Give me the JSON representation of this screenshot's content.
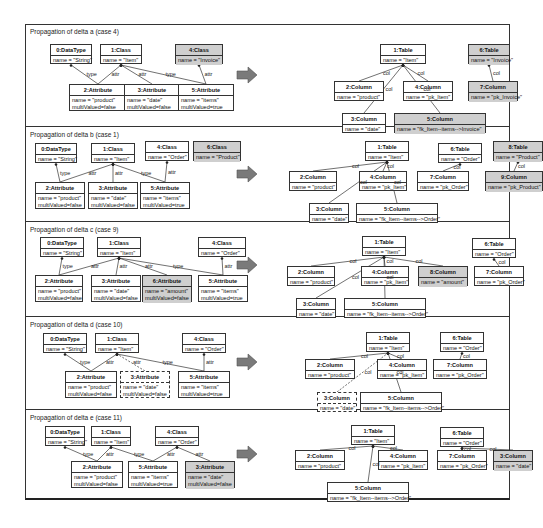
{
  "colors": {
    "border": "#333333",
    "highlight": "#cfcfcf",
    "arrow": "#7a7a7a"
  },
  "arrow_icon": "right-arrow-icon",
  "panels": [
    {
      "title": "Propagation of delta a (case 4)",
      "source": [
        {
          "id": "0:DataType",
          "attrs": [
            "name = \"String\""
          ]
        },
        {
          "id": "1:Class",
          "attrs": [
            "name = \"Item\""
          ]
        },
        {
          "id": "4:Class",
          "attrs": [
            "name = \"Invoice\""
          ],
          "highlight": true
        },
        {
          "id": "2:Attribute",
          "attrs": [
            "name = \"product\"",
            "multiValued=false"
          ]
        },
        {
          "id": "3:Attribute",
          "attrs": [
            "name = \"date\"",
            "multiValued=false"
          ]
        },
        {
          "id": "5:Attribute",
          "attrs": [
            "name = \"items\"",
            "multiValued=true"
          ]
        }
      ],
      "target": [
        {
          "id": "1:Table",
          "attrs": [
            "name = \"Item\""
          ]
        },
        {
          "id": "6:Table",
          "attrs": [
            "name = \"Invoice\""
          ],
          "highlight": true
        },
        {
          "id": "2:Column",
          "attrs": [
            "name = \"product\""
          ]
        },
        {
          "id": "4:Column",
          "attrs": [
            "name = \"pk_Item\""
          ]
        },
        {
          "id": "7:Column",
          "attrs": [
            "name = \"pk_Invoice\""
          ],
          "highlight": true
        },
        {
          "id": "3:Column",
          "attrs": [
            "name = \"date\""
          ]
        },
        {
          "id": "5:Column",
          "attrs": [
            "name = \"fk_Item--items-->Invoice\""
          ],
          "highlight": true
        }
      ]
    },
    {
      "title": "Propagation of delta b (case 1)",
      "source": [
        {
          "id": "0:DataType",
          "attrs": [
            "name = \"String\""
          ]
        },
        {
          "id": "1:Class",
          "attrs": [
            "name = \"Item\""
          ]
        },
        {
          "id": "4:Class",
          "attrs": [
            "name = \"Order\""
          ]
        },
        {
          "id": "6:Class",
          "attrs": [
            "name = \"Product\""
          ],
          "highlight": true
        },
        {
          "id": "2:Attribute",
          "attrs": [
            "name = \"product\"",
            "multiValued=false"
          ]
        },
        {
          "id": "3:Attribute",
          "attrs": [
            "name = \"date\"",
            "multiValued=false"
          ]
        },
        {
          "id": "5:Attribute",
          "attrs": [
            "name = \"items\"",
            "multiValued=true"
          ]
        }
      ],
      "target": [
        {
          "id": "1:Table",
          "attrs": [
            "name = \"Item\""
          ]
        },
        {
          "id": "6:Table",
          "attrs": [
            "name = \"Order\""
          ]
        },
        {
          "id": "8:Table",
          "attrs": [
            "name = \"Product\""
          ],
          "highlight": true
        },
        {
          "id": "2:Column",
          "attrs": [
            "name = \"product\""
          ]
        },
        {
          "id": "4:Column",
          "attrs": [
            "name = \"pk_Item\""
          ]
        },
        {
          "id": "7:Column",
          "attrs": [
            "name = \"pk_Order\""
          ]
        },
        {
          "id": "9:Column",
          "attrs": [
            "name = \"pk_Product\""
          ],
          "highlight": true
        },
        {
          "id": "3:Column",
          "attrs": [
            "name = \"date\""
          ]
        },
        {
          "id": "5:Column",
          "attrs": [
            "name = \"fk_Item--items-->Order\""
          ]
        }
      ]
    },
    {
      "title": "Propagation of delta c (case 9)",
      "source": [
        {
          "id": "0:DataType",
          "attrs": [
            "name = \"String\""
          ]
        },
        {
          "id": "1:Class",
          "attrs": [
            "name = \"Item\""
          ]
        },
        {
          "id": "4:Class",
          "attrs": [
            "name = \"Order\""
          ]
        },
        {
          "id": "2:Attribute",
          "attrs": [
            "name = \"product\"",
            "multiValued=false"
          ]
        },
        {
          "id": "3:Attribute",
          "attrs": [
            "name = \"date\"",
            "multiValued=false"
          ]
        },
        {
          "id": "6:Attribute",
          "attrs": [
            "name = \"amount\"",
            "multiValued=false"
          ],
          "highlight": true
        },
        {
          "id": "5:Attribute",
          "attrs": [
            "name = \"items\"",
            "multiValued=true"
          ]
        }
      ],
      "target": [
        {
          "id": "1:Table",
          "attrs": [
            "name = \"Item\""
          ]
        },
        {
          "id": "6:Table",
          "attrs": [
            "name = \"Order\""
          ]
        },
        {
          "id": "2:Column",
          "attrs": [
            "name = \"product\""
          ]
        },
        {
          "id": "4:Column",
          "attrs": [
            "name = \"pk_Item\""
          ]
        },
        {
          "id": "8:Column",
          "attrs": [
            "name = \"amount\""
          ],
          "highlight": true
        },
        {
          "id": "7:Column",
          "attrs": [
            "name = \"pk_Order\""
          ]
        },
        {
          "id": "3:Column",
          "attrs": [
            "name = \"date\""
          ]
        },
        {
          "id": "5:Column",
          "attrs": [
            "name = \"fk_Item--items-->Order\""
          ]
        }
      ]
    },
    {
      "title": "Propagation of delta d (case 10)",
      "source": [
        {
          "id": "0:DataType",
          "attrs": [
            "name = \"String\""
          ]
        },
        {
          "id": "1:Class",
          "attrs": [
            "name = \"Item\""
          ]
        },
        {
          "id": "4:Class",
          "attrs": [
            "name = \"Order\""
          ]
        },
        {
          "id": "2:Attribute",
          "attrs": [
            "name = \"product\"",
            "multiValued=false"
          ]
        },
        {
          "id": "3:Attribute",
          "attrs": [
            "name = \"date\"",
            "multiValued=false"
          ],
          "dashed": true
        },
        {
          "id": "5:Attribute",
          "attrs": [
            "name = \"items\"",
            "multiValued=true"
          ]
        }
      ],
      "target": [
        {
          "id": "1:Table",
          "attrs": [
            "name = \"Item\""
          ]
        },
        {
          "id": "6:Table",
          "attrs": [
            "name = \"Order\""
          ]
        },
        {
          "id": "2:Column",
          "attrs": [
            "name = \"product\""
          ]
        },
        {
          "id": "4:Column",
          "attrs": [
            "name = \"pk_Item\""
          ]
        },
        {
          "id": "7:Column",
          "attrs": [
            "name = \"pk_Order\""
          ]
        },
        {
          "id": "3:Column",
          "attrs": [
            "name = \"date\""
          ],
          "dashed": true
        },
        {
          "id": "5:Column",
          "attrs": [
            "name = \"fk_Item--items-->Order\""
          ]
        }
      ]
    },
    {
      "title": "Propagation of delta e (case 11)",
      "source": [
        {
          "id": "0:DataType",
          "attrs": [
            "name = \"String\""
          ]
        },
        {
          "id": "1:Class",
          "attrs": [
            "name = \"Item\""
          ]
        },
        {
          "id": "4:Class",
          "attrs": [
            "name = \"Order\""
          ]
        },
        {
          "id": "2:Attribute",
          "attrs": [
            "name = \"product\"",
            "multiValued=false"
          ]
        },
        {
          "id": "5:Attribute",
          "attrs": [
            "name = \"items\"",
            "multiValued=true"
          ]
        },
        {
          "id": "3:Attribute",
          "attrs": [
            "name = \"date\"",
            "multiValued=false"
          ],
          "highlight": true
        }
      ],
      "target": [
        {
          "id": "1:Table",
          "attrs": [
            "name = \"Item\""
          ]
        },
        {
          "id": "6:Table",
          "attrs": [
            "name = \"Order\""
          ]
        },
        {
          "id": "2:Column",
          "attrs": [
            "name = \"product\""
          ]
        },
        {
          "id": "4:Column",
          "attrs": [
            "name = \"pk_Item\""
          ]
        },
        {
          "id": "7:Column",
          "attrs": [
            "name = \"pk_Order\""
          ]
        },
        {
          "id": "3:Column",
          "attrs": [
            "name = \"date\""
          ],
          "highlight": true
        },
        {
          "id": "5:Column",
          "attrs": [
            "name = \"fk_Item--items-->Order\""
          ]
        }
      ]
    }
  ],
  "edge_labels": {
    "type": "type",
    "attr": "attr",
    "col": "col"
  }
}
